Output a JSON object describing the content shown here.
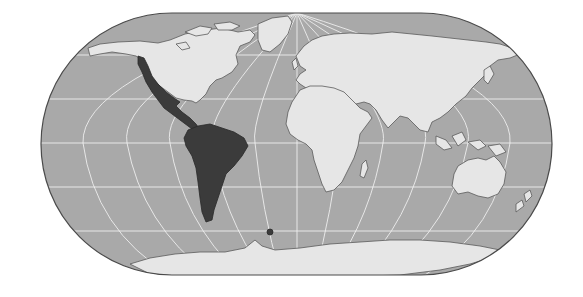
{
  "map": {
    "projection": "oblique-world",
    "highlighted_region": "Latin America",
    "colors": {
      "background": "#ffffff",
      "ocean": "#a9a9a9",
      "land": "#e6e6e6",
      "highlight": "#3b3b3b",
      "coast": "#5a5a5a",
      "grid": "#f2f2f2",
      "frame": "#4a4a4a"
    },
    "frame": {
      "x": 41,
      "y": 13,
      "width": 511,
      "height": 262,
      "radius": 131
    },
    "parallels_y": [
      55,
      99,
      143,
      187,
      231
    ],
    "pole": {
      "x": 297,
      "y": 13
    }
  }
}
